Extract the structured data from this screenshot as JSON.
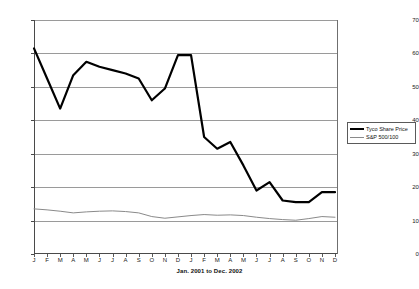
{
  "chart_data": {
    "type": "line",
    "title": "",
    "subtitle": "",
    "xlabel": "Jan. 2001 to Dec. 2002",
    "ylabel": "",
    "xlim": [
      0,
      23
    ],
    "ylim": [
      0,
      70
    ],
    "ytick_step": 10,
    "grid": true,
    "legend_position": "right",
    "categories": [
      "J",
      "F",
      "M",
      "A",
      "M",
      "J",
      "J",
      "A",
      "S",
      "O",
      "N",
      "D",
      "J",
      "F",
      "M",
      "A",
      "M",
      "J",
      "J",
      "A",
      "S",
      "O",
      "N",
      "D"
    ],
    "yticks": [
      "0",
      "10",
      "20",
      "30",
      "40",
      "50",
      "60",
      "70"
    ],
    "series": [
      {
        "name": "Tyco Share Price",
        "color": "#000000",
        "width": 2.2,
        "values": [
          61.5,
          52.5,
          43.5,
          53.5,
          57.5,
          56.0,
          55.0,
          54.0,
          52.5,
          46.0,
          49.5,
          59.5,
          59.5,
          35.0,
          31.5,
          33.5,
          26.5,
          19.0,
          21.5,
          16.0,
          15.5,
          15.5,
          18.5,
          18.5
        ]
      },
      {
        "name": "S&P 500/100",
        "color": "#8a8a8a",
        "width": 1.0,
        "values": [
          13.5,
          13.2,
          12.8,
          12.3,
          12.6,
          12.8,
          12.9,
          12.7,
          12.3,
          11.2,
          10.7,
          11.1,
          11.5,
          11.8,
          11.6,
          11.7,
          11.5,
          11.0,
          10.6,
          10.3,
          10.1,
          10.6,
          11.2,
          11.0
        ]
      }
    ]
  },
  "legend": {
    "items": [
      {
        "label": "Tyco Share Price"
      },
      {
        "label": "S&P 500/100"
      }
    ]
  },
  "axis": {
    "x_title": "Jan. 2001 to Dec. 2002"
  },
  "colors": {
    "tyco_line": "#000000",
    "sp_line": "#8a8a8a",
    "gridline": "#9a9a9a",
    "axis": "#4a4a4a",
    "background": "#ffffff"
  }
}
